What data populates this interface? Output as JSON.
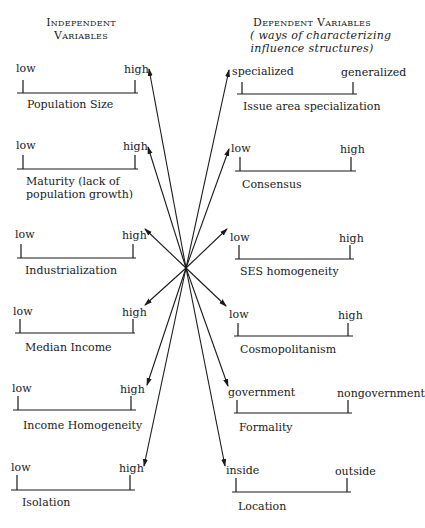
{
  "header": {
    "independent": {
      "line1": "Independent",
      "line2": "Variables"
    },
    "dependent": {
      "line1": "Dependent Variables",
      "line2": "( ways of characterizing",
      "line3": "influence structures)"
    }
  },
  "independent_variables": [
    {
      "name": "Population Size",
      "low": "low",
      "high": "high"
    },
    {
      "name": "Maturity (lack of",
      "name2": "population growth)",
      "low": "low",
      "high": "high"
    },
    {
      "name": "Industrialization",
      "low": "low",
      "high": "high"
    },
    {
      "name": "Median Income",
      "low": "low",
      "high": "high"
    },
    {
      "name": "Income Homogeneity",
      "low": "low",
      "high": "high"
    },
    {
      "name": "Isolation",
      "low": "low",
      "high": "high"
    }
  ],
  "dependent_variables": [
    {
      "name": "Issue area specialization",
      "low": "specialized",
      "high": "generalized"
    },
    {
      "name": "Consensus",
      "low": "low",
      "high": "high"
    },
    {
      "name": "SES homogeneity",
      "low": "low",
      "high": "high"
    },
    {
      "name": "Cosmopolitanism",
      "low": "low",
      "high": "high"
    },
    {
      "name": "Formality",
      "low": "government",
      "high": "nongovernment"
    },
    {
      "name": "Location",
      "low": "inside",
      "high": "outside"
    }
  ],
  "colors": {
    "ink": "#1a1a1a",
    "background": "#ffffff"
  }
}
